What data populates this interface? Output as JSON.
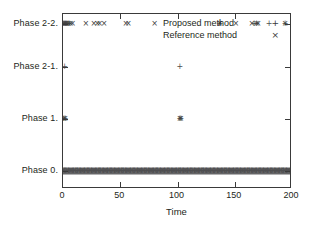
{
  "chart_data": {
    "type": "scatter",
    "title": "",
    "xlabel": "Time",
    "ylabel": "",
    "xlim": [
      0,
      200
    ],
    "xticks": [
      0,
      50,
      100,
      150,
      200
    ],
    "xticklabels": [
      "0",
      "50",
      "100",
      "150",
      "200"
    ],
    "ycategories": [
      "Phase 0.",
      "Phase 1.",
      "Phase 2-1.",
      "Phase 2-2."
    ],
    "yticklabels": [
      "Phase 2-2.",
      "Phase 2-1.",
      "Phase 1.",
      "Phase 0."
    ],
    "grid": false,
    "legend_position": "top-right",
    "series": [
      {
        "name": "Proposed method",
        "marker": "+",
        "color": "#505050",
        "points": [
          {
            "x": 0.4,
            "y": "Phase 2-2."
          },
          {
            "x": 1.2,
            "y": "Phase 2-2."
          },
          {
            "x": 2.0,
            "y": "Phase 2-2."
          },
          {
            "x": 3.0,
            "y": "Phase 2-2."
          },
          {
            "x": 4.2,
            "y": "Phase 2-2."
          },
          {
            "x": 5.4,
            "y": "Phase 2-2."
          },
          {
            "x": 137.0,
            "y": "Phase 2-2."
          },
          {
            "x": 167.0,
            "y": "Phase 2-2."
          },
          {
            "x": 169.0,
            "y": "Phase 2-2."
          },
          {
            "x": 180.0,
            "y": "Phase 2-2."
          },
          {
            "x": 194.0,
            "y": "Phase 2-2."
          },
          {
            "x": 1.5,
            "y": "Phase 2-1."
          },
          {
            "x": 102.0,
            "y": "Phase 2-1."
          },
          {
            "x": 0.8,
            "y": "Phase 1."
          },
          {
            "x": 1.8,
            "y": "Phase 1."
          },
          {
            "x": 102.0,
            "y": "Phase 1."
          },
          {
            "x": 103.0,
            "y": "Phase 1."
          }
        ]
      },
      {
        "name": "Reference method",
        "marker": "×",
        "color": "#404040",
        "points": [
          {
            "x": 0.5,
            "y": "Phase 2-2."
          },
          {
            "x": 1.6,
            "y": "Phase 2-2."
          },
          {
            "x": 2.6,
            "y": "Phase 2-2."
          },
          {
            "x": 3.6,
            "y": "Phase 2-2."
          },
          {
            "x": 5.0,
            "y": "Phase 2-2."
          },
          {
            "x": 6.6,
            "y": "Phase 2-2."
          },
          {
            "x": 8.4,
            "y": "Phase 2-2."
          },
          {
            "x": 20.0,
            "y": "Phase 2-2."
          },
          {
            "x": 27.0,
            "y": "Phase 2-2."
          },
          {
            "x": 30.0,
            "y": "Phase 2-2."
          },
          {
            "x": 32.0,
            "y": "Phase 2-2."
          },
          {
            "x": 36.0,
            "y": "Phase 2-2."
          },
          {
            "x": 55.0,
            "y": "Phase 2-2."
          },
          {
            "x": 57.0,
            "y": "Phase 2-2."
          },
          {
            "x": 80.0,
            "y": "Phase 2-2."
          },
          {
            "x": 137.0,
            "y": "Phase 2-2."
          },
          {
            "x": 151.0,
            "y": "Phase 2-2."
          },
          {
            "x": 165.0,
            "y": "Phase 2-2."
          },
          {
            "x": 169.0,
            "y": "Phase 2-2."
          },
          {
            "x": 170.5,
            "y": "Phase 2-2."
          },
          {
            "x": 194.0,
            "y": "Phase 2-2."
          },
          {
            "x": 0.8,
            "y": "Phase 1."
          },
          {
            "x": 1.8,
            "y": "Phase 1."
          },
          {
            "x": 102.0,
            "y": "Phase 1."
          },
          {
            "x": 103.0,
            "y": "Phase 1."
          }
        ]
      }
    ],
    "dense_rows": [
      {
        "y": "Phase 0.",
        "x_start": 0,
        "x_end": 200,
        "note": "continuous dense band of overlapping markers from both series"
      }
    ]
  },
  "legend": {
    "entries": [
      {
        "label": "Proposed method",
        "marker": "+"
      },
      {
        "label": "Reference method",
        "marker": "×"
      }
    ]
  },
  "axes": {
    "x_title": "Time",
    "x_ticklabels": [
      "0",
      "50",
      "100",
      "150",
      "200"
    ],
    "y_ticklabels": [
      "Phase 2-2.",
      "Phase 2-1.",
      "Phase 1.",
      "Phase 0."
    ]
  },
  "colors": {
    "frame": "#3a3a3a",
    "text": "#231f20",
    "marker_plus": "#505050",
    "marker_cross": "#404040",
    "dense_band": "#58585a",
    "background": "#ffffff"
  }
}
